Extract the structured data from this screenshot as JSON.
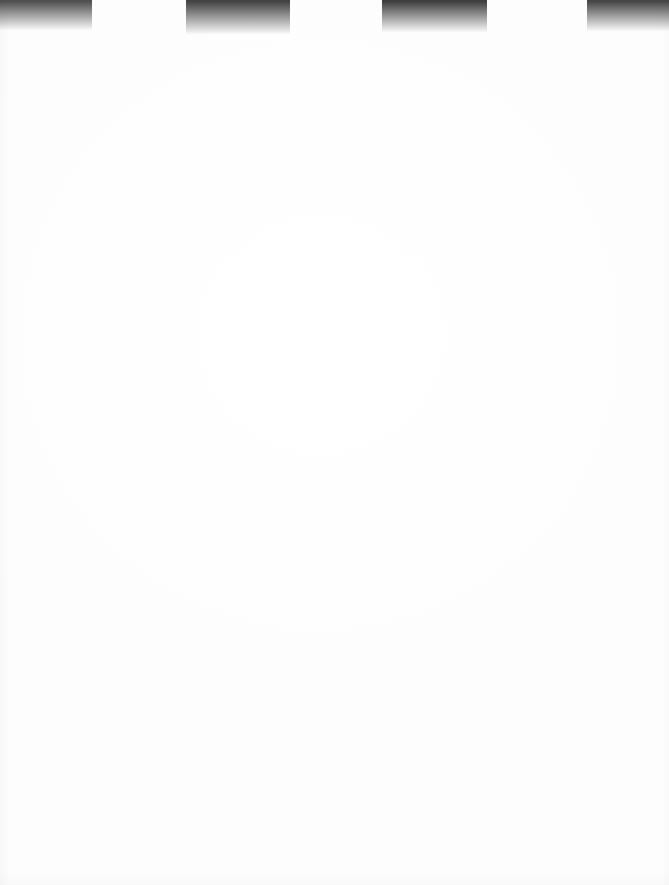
{
  "document": {
    "kind": "scanned-page",
    "page_label": "",
    "body_text": "",
    "width_px": 669,
    "height_px": 885,
    "background_color": "#ffffff",
    "content_note": "blank page"
  },
  "scan_artifacts": {
    "description": "dark gradient bands along top edge of scan",
    "band_count": 4,
    "bands": [
      {
        "name": "top-edge-band-1",
        "x": 0,
        "width": 92,
        "height": 31,
        "color_top": "#4f4f4f",
        "color_bottom": "#ffffff"
      },
      {
        "name": "top-edge-band-2",
        "x": 186,
        "width": 104,
        "height": 35,
        "color_top": "#434343",
        "color_bottom": "#ffffff"
      },
      {
        "name": "top-edge-band-3",
        "x": 382,
        "width": 105,
        "height": 33,
        "color_top": "#3e3e3e",
        "color_bottom": "#ffffff"
      },
      {
        "name": "top-edge-band-4",
        "x": 587,
        "width": 82,
        "height": 32,
        "color_top": "#464646",
        "color_bottom": "#ffffff"
      }
    ]
  }
}
